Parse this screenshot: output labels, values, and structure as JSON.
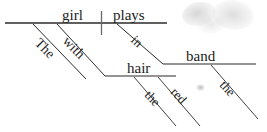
{
  "diagram": {
    "type": "reed-kellogg-sentence-diagram",
    "sentence": "The girl plays with red hair in the band",
    "ink_color": "#2b2b2b",
    "background_color": "#ffffff",
    "labels": {
      "subject": "girl",
      "verb": "plays",
      "subject_article": "The",
      "preposition_with": "with",
      "object_of_with": "hair",
      "hair_article": "the",
      "hair_modifier": "red",
      "preposition_in": "in",
      "object_of_in": "band",
      "band_article": "the"
    },
    "lines": {
      "main_baseline": {
        "x1": 5,
        "y1": 23,
        "x2": 167,
        "y2": 23
      },
      "subject_verb_divider": {
        "x1": 101,
        "y1": 11,
        "x2": 101,
        "y2": 35
      },
      "the_diagonal": {
        "x1": 33,
        "y1": 24,
        "x2": 86,
        "y2": 79
      },
      "with_diagonal": {
        "x1": 57,
        "y1": 24,
        "x2": 105,
        "y2": 76
      },
      "hair_baseline": {
        "x1": 105,
        "y1": 76,
        "x2": 176,
        "y2": 76
      },
      "in_diagonal": {
        "x1": 117,
        "y1": 24,
        "x2": 163,
        "y2": 64
      },
      "band_baseline": {
        "x1": 163,
        "y1": 64,
        "x2": 256,
        "y2": 64
      },
      "hair_the_diagonal": {
        "x1": 134,
        "y1": 77,
        "x2": 176,
        "y2": 126
      },
      "hair_red_diagonal": {
        "x1": 158,
        "y1": 77,
        "x2": 200,
        "y2": 126
      },
      "band_the_diagonal": {
        "x1": 211,
        "y1": 65,
        "x2": 258,
        "y2": 119
      }
    }
  }
}
